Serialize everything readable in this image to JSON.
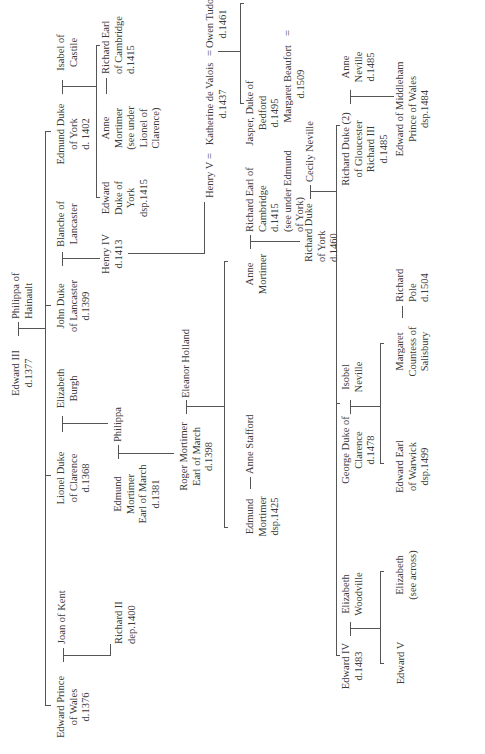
{
  "diagram": {
    "type": "family-tree",
    "orientation": "rotated-90-ccw",
    "line_color": "#555555",
    "text_color": "#3a3a3a",
    "background": "#ffffff"
  },
  "people": {
    "edward_iii": [
      "Edward III",
      "d.1377"
    ],
    "philippa_hainault": [
      "Philippa of",
      "Hainault"
    ],
    "edward_black_prince": [
      "Edward Prince",
      "of Wales",
      "d.1376"
    ],
    "joan_kent": [
      "Joan of Kent"
    ],
    "richard_ii": [
      "Richard II",
      "dep.1400"
    ],
    "lionel": [
      "Lionel Duke",
      "of Clarence",
      "d.1368"
    ],
    "elizabeth_burgh": [
      "Elizabeth",
      "Burgh"
    ],
    "philippa": [
      "Philippa"
    ],
    "edmund_mortimer_1381": [
      "Edmund",
      "Mortimer",
      "Earl of March",
      "d.1381"
    ],
    "roger_mortimer": [
      "Roger Mortimer",
      "Earl of March",
      "d.1398"
    ],
    "eleanor_holland": [
      "Eleanor Holland"
    ],
    "edmund_mortimer_1425": [
      "Edmund",
      "Mortimer",
      "dsp.1425"
    ],
    "anne_stafford": [
      "Anne Stafford"
    ],
    "anne_mortimer": [
      "Anne",
      "Mortimer"
    ],
    "richard_cambridge_a": [
      "Richard Earl of",
      "Cambridge",
      "d.1415",
      "(see under Edmund",
      "of York)"
    ],
    "richard_york": [
      "Richard Duke",
      "of York",
      "d.1460"
    ],
    "cecily_neville": [
      "Cecily Neville"
    ],
    "john_gaunt": [
      "John Duke",
      "of Lancaster",
      "d.1399"
    ],
    "blanche": [
      "Blanche of",
      "Lancaster"
    ],
    "henry_iv": [
      "Henry IV",
      "d.1413"
    ],
    "henry_v": [
      "Henry V"
    ],
    "katherine": [
      "Katherine de Valois",
      "d.1437"
    ],
    "owen_tudor": [
      "Owen Tudor",
      "d.1461"
    ],
    "jasper": [
      "Jasper, Duke of",
      "Bedford",
      "d.1495"
    ],
    "margaret_beaufort": [
      "Margaret Beaufort",
      "d.1509"
    ],
    "edmund_tudor": [
      "Edmund Tudor",
      "Earl of Richmond",
      "d.1456"
    ],
    "henry_vii": [
      "Henry VII",
      "d.1509"
    ],
    "elizabeth_york": [
      "Elizabeth of York",
      "d.1503"
    ],
    "edmund_york": [
      "Edmund Duke",
      "of York",
      "d. 1402"
    ],
    "isabel_castile": [
      "Isabel of",
      "Castile"
    ],
    "edward_york": [
      "Edward",
      "Duke of",
      "York",
      "dsp.1415"
    ],
    "anne_mortimer_b": [
      "Anne",
      "Mortimer",
      "(see under",
      "Lionel of",
      "Clarence)"
    ],
    "richard_cambridge_b": [
      "Richard Earl",
      "of Cambridge",
      "d.1415"
    ],
    "edward_iv": [
      "Edward IV",
      "d.1483"
    ],
    "elizabeth_woodville": [
      "Elizabeth",
      "Woodville"
    ],
    "edward_v": [
      "Edward V"
    ],
    "elizabeth_see_across": [
      "Elizabeth",
      "(see across)"
    ],
    "george_clarence": [
      "George Duke of",
      "Clarence",
      "d.1478"
    ],
    "isobel_neville": [
      "Isobel",
      "Neville"
    ],
    "edward_warwick": [
      "Edward Earl",
      "of Warwick",
      "dsp.1499"
    ],
    "margaret_salisbury": [
      "Margaret",
      "Countess of",
      "Salisbury"
    ],
    "richard_pole": [
      "Richard",
      "Pole",
      "d.1504"
    ],
    "richard_iii": [
      "Richard Duke (2)",
      "of Gloucester",
      "Richard III",
      "d.1485"
    ],
    "anne_neville": [
      "Anne",
      "Neville",
      "d.1485"
    ],
    "edward_middleham": [
      "Edward of Middleham",
      "Prince of Wales",
      "dsp.1484"
    ]
  },
  "symbols": {
    "marriage_equals": "=",
    "marriage_dash": "—"
  }
}
